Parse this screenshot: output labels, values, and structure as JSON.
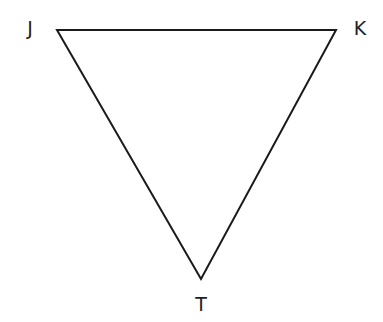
{
  "diagram": {
    "type": "triangle",
    "stroke_color": "#1a1a1a",
    "background": "#ffffff",
    "vertices": [
      {
        "name": "J",
        "x": 57,
        "y": 30,
        "label_x": 30,
        "label_y": 35
      },
      {
        "name": "K",
        "x": 336,
        "y": 30,
        "label_x": 360,
        "label_y": 35
      },
      {
        "name": "T",
        "x": 201,
        "y": 279,
        "label_x": 201,
        "label_y": 311
      }
    ],
    "labels": {
      "J": "J",
      "K": "K",
      "T": "T"
    }
  }
}
